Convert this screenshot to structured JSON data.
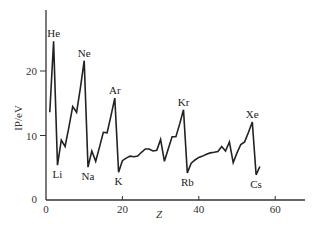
{
  "chart_data": {
    "type": "line",
    "title": "",
    "xlabel": "Z",
    "ylabel": "IP/eV",
    "xlim": [
      0,
      68
    ],
    "ylim": [
      0,
      29
    ],
    "xticks": [
      0,
      20,
      40,
      60
    ],
    "yticks": [
      0,
      10,
      20
    ],
    "grid": false,
    "legend": null,
    "series": [
      {
        "name": "First ionization potential",
        "x": [
          1,
          2,
          3,
          4,
          5,
          6,
          7,
          8,
          9,
          10,
          11,
          12,
          13,
          14,
          15,
          16,
          17,
          18,
          19,
          20,
          21,
          22,
          23,
          24,
          25,
          26,
          27,
          28,
          29,
          30,
          31,
          32,
          33,
          34,
          35,
          36,
          37,
          38,
          39,
          40,
          41,
          42,
          43,
          44,
          45,
          46,
          47,
          48,
          49,
          50,
          51,
          52,
          53,
          54,
          55,
          56
        ],
        "values": [
          13.6,
          24.6,
          5.4,
          9.3,
          8.3,
          11.3,
          14.5,
          13.6,
          17.4,
          21.6,
          5.1,
          7.6,
          6.0,
          8.2,
          10.5,
          10.4,
          13.0,
          15.8,
          4.3,
          6.1,
          6.5,
          6.8,
          6.7,
          6.8,
          7.4,
          7.9,
          7.9,
          7.6,
          7.7,
          9.4,
          6.0,
          7.9,
          9.8,
          9.8,
          11.8,
          14.0,
          4.2,
          5.7,
          6.2,
          6.6,
          6.8,
          7.1,
          7.3,
          7.4,
          7.5,
          8.3,
          7.6,
          9.0,
          5.8,
          7.3,
          8.6,
          9.0,
          10.5,
          12.1,
          3.9,
          5.2
        ]
      }
    ],
    "annotations": [
      {
        "text": "He",
        "x": 2,
        "y": 24.6,
        "position": "above"
      },
      {
        "text": "Ne",
        "x": 10,
        "y": 21.6,
        "position": "above"
      },
      {
        "text": "Ar",
        "x": 18,
        "y": 15.8,
        "position": "above"
      },
      {
        "text": "Kr",
        "x": 36,
        "y": 14.0,
        "position": "above"
      },
      {
        "text": "Xe",
        "x": 54,
        "y": 12.1,
        "position": "above"
      },
      {
        "text": "Li",
        "x": 3,
        "y": 5.4,
        "position": "below"
      },
      {
        "text": "Na",
        "x": 11,
        "y": 5.1,
        "position": "below"
      },
      {
        "text": "K",
        "x": 19,
        "y": 4.3,
        "position": "below"
      },
      {
        "text": "Rb",
        "x": 37,
        "y": 4.2,
        "position": "below"
      },
      {
        "text": "Cs",
        "x": 55,
        "y": 3.9,
        "position": "below"
      }
    ]
  },
  "layout": {
    "origin_px": [
      46,
      200
    ],
    "px_per_x": 3.82,
    "px_per_y": 6.45,
    "x_axis_end_px": 305,
    "y_axis_top_px": 10,
    "line_color": "#222222",
    "axis_color": "#333333"
  }
}
